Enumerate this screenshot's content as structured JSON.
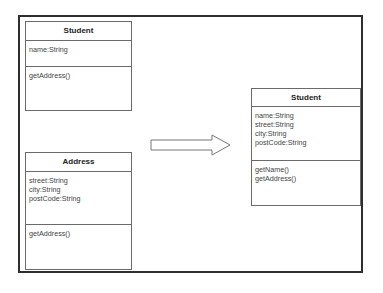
{
  "diagram": {
    "left_classes": [
      {
        "name": "Student",
        "attributes": [
          "name:String"
        ],
        "operations": [
          "getAddress()"
        ]
      },
      {
        "name": "Address",
        "attributes": [
          "street:String",
          "city:String",
          "postCode:String"
        ],
        "operations": [
          "getAddress()"
        ]
      }
    ],
    "result_class": {
      "name": "Student",
      "attributes": [
        "name:String",
        "street:String",
        "city:String",
        "postCode:String"
      ],
      "operations": [
        "getName()",
        "getAddress()"
      ]
    },
    "arrow": {
      "direction": "right",
      "icon": "block-arrow-right-icon"
    },
    "colors": {
      "frame": "#2e2e2e",
      "box_border": "#6a6a6a",
      "text": "#444444"
    }
  }
}
